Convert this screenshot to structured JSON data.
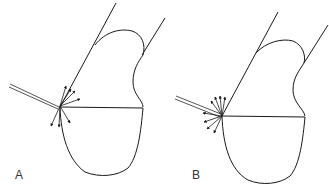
{
  "panels": [
    {
      "id": "A",
      "label": "A",
      "arrow_count": 7,
      "description": "probe tip with arrows radiating along wall and downward"
    },
    {
      "id": "B",
      "label": "B",
      "arrow_count": 8,
      "description": "probe tip with arrows radiating outward in a fan"
    }
  ],
  "colors": {
    "line": "#1a1a1a",
    "probe": "#555555",
    "label": "#333333",
    "background": "#ffffff"
  }
}
